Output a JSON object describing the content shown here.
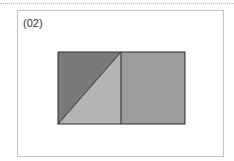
{
  "figure": {
    "label": "(02)",
    "colors": {
      "dark_triangle": "#7a7a7a",
      "light_triangle": "#b4b4b4",
      "right_square": "#9c9c9c",
      "outline": "#2a2a2a",
      "frame": "#c4c4c4"
    }
  }
}
